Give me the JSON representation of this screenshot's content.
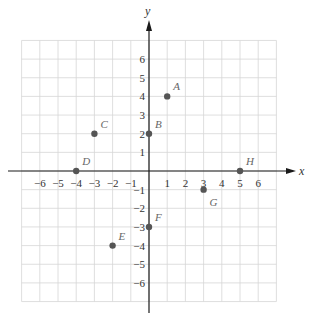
{
  "chart_data": {
    "type": "scatter",
    "title": "",
    "xlabel": "x",
    "ylabel": "y",
    "xlim": [
      -7,
      7
    ],
    "ylim": [
      -7,
      7
    ],
    "grid": true,
    "x_ticks": [
      -6,
      -5,
      -4,
      -3,
      -2,
      -1,
      1,
      2,
      3,
      4,
      5,
      6
    ],
    "y_ticks": [
      -6,
      -5,
      -4,
      -3,
      -2,
      -1,
      1,
      2,
      3,
      4,
      5,
      6
    ],
    "x_tick_labels": [
      "−6",
      "−5",
      "−4",
      "−3",
      "−2",
      "−1",
      "1",
      "2",
      "3",
      "4",
      "5",
      "6"
    ],
    "y_tick_labels": [
      "−6",
      "−5",
      "−4",
      "−3",
      "−2",
      "−1",
      "1",
      "2",
      "3",
      "4",
      "5",
      "6"
    ],
    "points": [
      {
        "label": "A",
        "x": 1,
        "y": 4
      },
      {
        "label": "B",
        "x": 0,
        "y": 2
      },
      {
        "label": "C",
        "x": -3,
        "y": 2
      },
      {
        "label": "D",
        "x": -4,
        "y": 0
      },
      {
        "label": "E",
        "x": -2,
        "y": -4
      },
      {
        "label": "F",
        "x": 0,
        "y": -3
      },
      {
        "label": "G",
        "x": 3,
        "y": -1
      },
      {
        "label": "H",
        "x": 5,
        "y": 0
      }
    ],
    "colors": {
      "point": "#555555",
      "grid": "#d6d6d6",
      "axis": "#1a1a1a"
    }
  }
}
